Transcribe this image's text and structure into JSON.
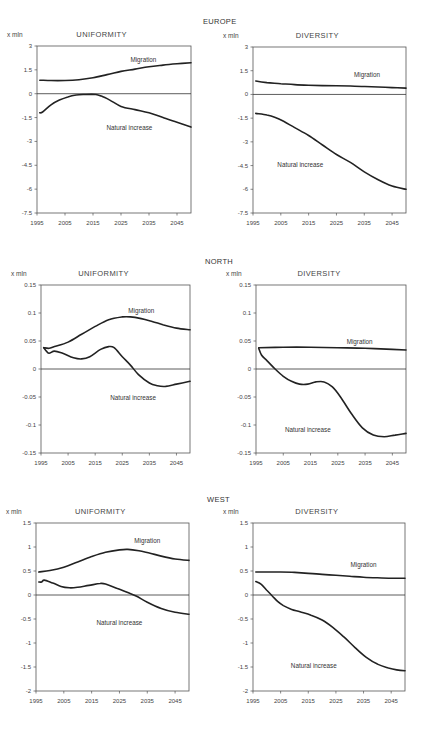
{
  "regions": [
    {
      "title": "EUROPE"
    },
    {
      "title": "NORTH"
    },
    {
      "title": "WEST"
    }
  ],
  "chart_data": [
    {
      "type": "line",
      "region": "EUROPE",
      "title": "UNIFORMITY",
      "ylabel": "x mln",
      "ylim": [
        -7.5,
        3
      ],
      "yticks": [
        3,
        1.5,
        0,
        -1.5,
        -3,
        -4.5,
        -6,
        -7.5
      ],
      "ytick_labels": [
        "3",
        "1.5",
        "0",
        "-1.5",
        "-3",
        "-4.5",
        "-6",
        "-7.5"
      ],
      "xlim": [
        1995,
        2050
      ],
      "xticks": [
        1995,
        2005,
        2015,
        2025,
        2035,
        2045
      ],
      "series": [
        {
          "name": "Migration",
          "label_pos": [
            2033,
            2.0
          ],
          "x": [
            1996,
            2000,
            2005,
            2010,
            2015,
            2020,
            2025,
            2030,
            2035,
            2040,
            2045,
            2050
          ],
          "values": [
            0.85,
            0.83,
            0.83,
            0.88,
            1.0,
            1.2,
            1.4,
            1.55,
            1.7,
            1.8,
            1.88,
            1.95
          ]
        },
        {
          "name": "Natural increase",
          "label_pos": [
            2028,
            -2.3
          ],
          "x": [
            1996,
            1997,
            2000,
            2003,
            2006,
            2009,
            2012,
            2016,
            2018,
            2021,
            2025,
            2030,
            2035,
            2040,
            2045,
            2050
          ],
          "values": [
            -1.2,
            -1.15,
            -0.7,
            -0.4,
            -0.2,
            -0.08,
            -0.05,
            -0.05,
            -0.15,
            -0.4,
            -0.8,
            -1.0,
            -1.2,
            -1.5,
            -1.8,
            -2.1
          ]
        }
      ]
    },
    {
      "type": "line",
      "region": "EUROPE",
      "title": "DIVERSITY",
      "ylabel": "x mln",
      "ylim": [
        -7.5,
        3
      ],
      "yticks": [
        3,
        1.5,
        0,
        -1.5,
        -3,
        -4.5,
        -6,
        -7.5
      ],
      "ytick_labels": [
        "3",
        "1.5",
        "0",
        "-1.5",
        "-3",
        "-4.5",
        "-6",
        "-7.5"
      ],
      "xlim": [
        1995,
        2050
      ],
      "xticks": [
        1995,
        2005,
        2015,
        2025,
        2035,
        2045
      ],
      "series": [
        {
          "name": "Migration",
          "label_pos": [
            2036,
            1.1
          ],
          "x": [
            1996,
            2000,
            2005,
            2010,
            2015,
            2020,
            2025,
            2030,
            2035,
            2040,
            2045,
            2050
          ],
          "values": [
            0.85,
            0.75,
            0.68,
            0.62,
            0.58,
            0.56,
            0.55,
            0.53,
            0.5,
            0.47,
            0.43,
            0.4
          ]
        },
        {
          "name": "Natural increase",
          "label_pos": [
            2012,
            -4.6
          ],
          "x": [
            1996,
            2000,
            2003,
            2006,
            2010,
            2015,
            2020,
            2025,
            2030,
            2035,
            2040,
            2045,
            2050
          ],
          "values": [
            -1.2,
            -1.3,
            -1.45,
            -1.7,
            -2.1,
            -2.6,
            -3.2,
            -3.8,
            -4.3,
            -4.9,
            -5.4,
            -5.8,
            -6.0
          ]
        }
      ]
    },
    {
      "type": "line",
      "region": "NORTH",
      "title": "UNIFORMITY",
      "ylabel": "x mln",
      "ylim": [
        -0.15,
        0.15
      ],
      "yticks": [
        0.15,
        0.1,
        0.05,
        0,
        -0.05,
        -0.1,
        -0.15
      ],
      "ytick_labels": [
        "0.15",
        "0.1",
        "0.05",
        "0",
        "-0.05",
        "-0.1",
        "-0.15"
      ],
      "xlim": [
        1995,
        2050
      ],
      "xticks": [
        1995,
        2005,
        2015,
        2025,
        2035,
        2045
      ],
      "series": [
        {
          "name": "Migration",
          "label_pos": [
            2032,
            0.1
          ],
          "x": [
            1996,
            1998,
            2000,
            2005,
            2010,
            2015,
            2020,
            2025,
            2028,
            2032,
            2036,
            2040,
            2045,
            2050
          ],
          "values": [
            0.038,
            0.037,
            0.04,
            0.048,
            0.062,
            0.076,
            0.088,
            0.093,
            0.093,
            0.09,
            0.085,
            0.079,
            0.073,
            0.07
          ]
        },
        {
          "name": "Natural increase",
          "label_pos": [
            2029,
            -0.055
          ],
          "x": [
            1996,
            1997,
            1998,
            2000,
            2003,
            2007,
            2010,
            2013,
            2017,
            2020,
            2022,
            2025,
            2028,
            2031,
            2035,
            2038,
            2041,
            2045,
            2050
          ],
          "values": [
            0.038,
            0.032,
            0.028,
            0.032,
            0.028,
            0.02,
            0.018,
            0.022,
            0.035,
            0.04,
            0.038,
            0.022,
            0.007,
            -0.01,
            -0.025,
            -0.03,
            -0.031,
            -0.027,
            -0.022
          ]
        }
      ]
    },
    {
      "type": "line",
      "region": "NORTH",
      "title": "DIVERSITY",
      "ylabel": "x mln",
      "ylim": [
        -0.15,
        0.15
      ],
      "yticks": [
        0.15,
        0.1,
        0.05,
        0,
        -0.05,
        -0.1,
        -0.15
      ],
      "ytick_labels": [
        "0.15",
        "0.1",
        "0.05",
        "0",
        "-0.05",
        "-0.1",
        "-0.15"
      ],
      "xlim": [
        1995,
        2050
      ],
      "xticks": [
        1995,
        2005,
        2015,
        2025,
        2035,
        2045
      ],
      "series": [
        {
          "name": "Migration",
          "label_pos": [
            2033,
            0.045
          ],
          "x": [
            1996,
            2005,
            2015,
            2025,
            2035,
            2045,
            2050
          ],
          "values": [
            0.038,
            0.039,
            0.039,
            0.038,
            0.037,
            0.035,
            0.034
          ]
        },
        {
          "name": "Natural increase",
          "label_pos": [
            2014,
            -0.113
          ],
          "x": [
            1996,
            1997,
            1999,
            2002,
            2005,
            2008,
            2011,
            2014,
            2017,
            2020,
            2023,
            2026,
            2030,
            2034,
            2038,
            2042,
            2046,
            2050
          ],
          "values": [
            0.037,
            0.025,
            0.015,
            0.0,
            -0.013,
            -0.022,
            -0.027,
            -0.027,
            -0.023,
            -0.023,
            -0.032,
            -0.05,
            -0.08,
            -0.105,
            -0.118,
            -0.121,
            -0.118,
            -0.115
          ]
        }
      ]
    },
    {
      "type": "line",
      "region": "WEST",
      "title": "UNIFORMITY",
      "ylabel": "x mln",
      "ylim": [
        -2,
        1.5
      ],
      "yticks": [
        1.5,
        1,
        0.5,
        0,
        -0.5,
        -1,
        -1.5,
        -2
      ],
      "ytick_labels": [
        "1.5",
        "1",
        "0.5",
        "0",
        "-0.5",
        "-1",
        "-1.5",
        "-2"
      ],
      "xlim": [
        1995,
        2050
      ],
      "xticks": [
        1995,
        2005,
        2015,
        2025,
        2035,
        2045
      ],
      "series": [
        {
          "name": "Migration",
          "label_pos": [
            2035,
            1.08
          ],
          "x": [
            1996,
            2000,
            2005,
            2010,
            2015,
            2020,
            2025,
            2028,
            2032,
            2036,
            2040,
            2045,
            2050
          ],
          "values": [
            0.48,
            0.51,
            0.58,
            0.69,
            0.8,
            0.89,
            0.94,
            0.95,
            0.92,
            0.87,
            0.81,
            0.75,
            0.72
          ]
        },
        {
          "name": "Natural increase",
          "label_pos": [
            2025,
            -0.62
          ],
          "x": [
            1996,
            1997,
            1998,
            2001,
            2004,
            2007,
            2010,
            2014,
            2018,
            2020,
            2024,
            2028,
            2031,
            2035,
            2040,
            2045,
            2050
          ],
          "values": [
            0.27,
            0.27,
            0.31,
            0.25,
            0.18,
            0.15,
            0.16,
            0.2,
            0.24,
            0.23,
            0.14,
            0.05,
            -0.02,
            -0.15,
            -0.28,
            -0.36,
            -0.4
          ]
        }
      ]
    },
    {
      "type": "line",
      "region": "WEST",
      "title": "DIVERSITY",
      "ylabel": "x mln",
      "ylim": [
        -2,
        1.5
      ],
      "yticks": [
        1.5,
        1,
        0.5,
        0,
        -0.5,
        -1,
        -1.5,
        -2
      ],
      "ytick_labels": [
        "1.5",
        "1",
        "0.5",
        "0",
        "-0.5",
        "-1",
        "-1.5",
        "-2"
      ],
      "xlim": [
        1995,
        2050
      ],
      "xticks": [
        1995,
        2005,
        2015,
        2025,
        2035,
        2045
      ],
      "series": [
        {
          "name": "Migration",
          "label_pos": [
            2035,
            0.58
          ],
          "x": [
            1996,
            2005,
            2010,
            2015,
            2020,
            2025,
            2030,
            2035,
            2040,
            2045,
            2050
          ],
          "values": [
            0.48,
            0.48,
            0.47,
            0.45,
            0.43,
            0.41,
            0.39,
            0.37,
            0.36,
            0.35,
            0.35
          ]
        },
        {
          "name": "Natural increase",
          "label_pos": [
            2017,
            -1.52
          ],
          "x": [
            1996,
            1998,
            2000,
            2002,
            2004,
            2006,
            2009,
            2012,
            2016,
            2020,
            2024,
            2028,
            2032,
            2036,
            2040,
            2044,
            2047,
            2050
          ],
          "values": [
            0.28,
            0.22,
            0.1,
            -0.02,
            -0.14,
            -0.22,
            -0.3,
            -0.35,
            -0.42,
            -0.52,
            -0.68,
            -0.88,
            -1.1,
            -1.3,
            -1.44,
            -1.52,
            -1.56,
            -1.58
          ]
        }
      ]
    }
  ]
}
